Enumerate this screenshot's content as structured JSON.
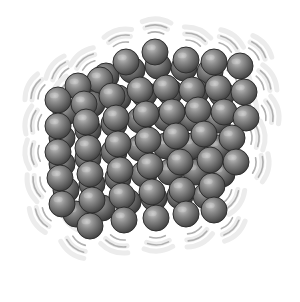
{
  "illustration": {
    "subject": "vibrating solid lattice of atoms",
    "background": "#ffffff",
    "sphere": {
      "radius": 13,
      "fill_light": "#b8b8b8",
      "fill_mid": "#7a7a7a",
      "fill_dark": "#3c3c3c",
      "stroke": "#2e2e2e"
    },
    "vibration_lines": {
      "color": "#b0b0b0",
      "halo": "#ececec"
    },
    "back_layer": [
      [
        80,
        88
      ],
      [
        106,
        76
      ],
      [
        132,
        70
      ],
      [
        158,
        66
      ],
      [
        184,
        68
      ],
      [
        210,
        72
      ],
      [
        66,
        112
      ],
      [
        92,
        104
      ],
      [
        118,
        98
      ],
      [
        144,
        94
      ],
      [
        170,
        92
      ],
      [
        196,
        92
      ],
      [
        222,
        94
      ],
      [
        62,
        138
      ],
      [
        88,
        130
      ],
      [
        114,
        124
      ],
      [
        140,
        120
      ],
      [
        166,
        118
      ],
      [
        192,
        118
      ],
      [
        218,
        120
      ],
      [
        62,
        164
      ],
      [
        88,
        158
      ],
      [
        114,
        152
      ],
      [
        140,
        148
      ],
      [
        166,
        146
      ],
      [
        192,
        146
      ],
      [
        218,
        148
      ],
      [
        66,
        190
      ],
      [
        92,
        184
      ],
      [
        118,
        178
      ],
      [
        144,
        174
      ],
      [
        170,
        172
      ],
      [
        196,
        172
      ],
      [
        222,
        174
      ],
      [
        76,
        214
      ],
      [
        102,
        208
      ],
      [
        128,
        202
      ],
      [
        154,
        198
      ],
      [
        180,
        196
      ],
      [
        206,
        196
      ]
    ],
    "front_layer": [
      [
        155,
        52
      ],
      [
        186,
        60
      ],
      [
        214,
        62
      ],
      [
        240,
        66
      ],
      [
        126,
        62
      ],
      [
        100,
        80
      ],
      [
        78,
        86
      ],
      [
        58,
        100
      ],
      [
        84,
        104
      ],
      [
        112,
        96
      ],
      [
        140,
        90
      ],
      [
        166,
        88
      ],
      [
        192,
        90
      ],
      [
        218,
        88
      ],
      [
        244,
        92
      ],
      [
        58,
        126
      ],
      [
        86,
        122
      ],
      [
        116,
        118
      ],
      [
        146,
        114
      ],
      [
        172,
        112
      ],
      [
        198,
        110
      ],
      [
        224,
        112
      ],
      [
        246,
        118
      ],
      [
        58,
        152
      ],
      [
        88,
        148
      ],
      [
        118,
        144
      ],
      [
        148,
        140
      ],
      [
        176,
        136
      ],
      [
        204,
        134
      ],
      [
        232,
        138
      ],
      [
        60,
        178
      ],
      [
        90,
        174
      ],
      [
        120,
        170
      ],
      [
        150,
        166
      ],
      [
        180,
        162
      ],
      [
        210,
        160
      ],
      [
        236,
        162
      ],
      [
        62,
        204
      ],
      [
        92,
        200
      ],
      [
        122,
        196
      ],
      [
        152,
        192
      ],
      [
        182,
        190
      ],
      [
        212,
        186
      ],
      [
        90,
        226
      ],
      [
        124,
        220
      ],
      [
        156,
        218
      ],
      [
        186,
        214
      ],
      [
        214,
        210
      ]
    ]
  }
}
